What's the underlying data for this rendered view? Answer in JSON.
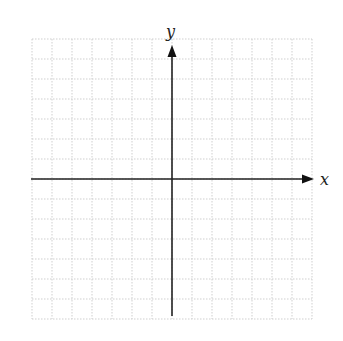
{
  "diagram": {
    "type": "cartesian-coordinate-plane",
    "x_axis_label": "x",
    "y_axis_label": "y",
    "grid": {
      "columns": 14,
      "rows": 14,
      "cell_size_px": 20,
      "origin_px": [
        172,
        179
      ],
      "left_px": 32,
      "right_px": 312,
      "top_px": 39,
      "bottom_px": 316,
      "line_style": "dotted",
      "line_color": "#cfcfcf"
    },
    "axes": {
      "color": "#222222",
      "x_axis_start_px": 31,
      "x_axis_end_px": 312,
      "y_axis_top_px": 46,
      "y_axis_bottom_px": 316,
      "arrow_directions": [
        "positive-x",
        "positive-y"
      ]
    }
  }
}
